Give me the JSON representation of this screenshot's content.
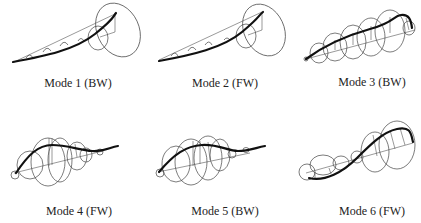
{
  "figure": {
    "panels": [
      {
        "id": "mode1",
        "label": "Mode 1 (BW)",
        "mode": 1,
        "whirl": "BW",
        "whirl_meaning": "backward whirl"
      },
      {
        "id": "mode2",
        "label": "Mode 2 (FW)",
        "mode": 2,
        "whirl": "FW",
        "whirl_meaning": "forward whirl"
      },
      {
        "id": "mode3",
        "label": "Mode 3 (BW)",
        "mode": 3,
        "whirl": "BW",
        "whirl_meaning": "backward whirl"
      },
      {
        "id": "mode4",
        "label": "Mode 4 (FW)",
        "mode": 4,
        "whirl": "FW",
        "whirl_meaning": "forward whirl"
      },
      {
        "id": "mode5",
        "label": "Mode 5 (BW)",
        "mode": 5,
        "whirl": "BW",
        "whirl_meaning": "backward whirl"
      },
      {
        "id": "mode6",
        "label": "Mode 6 (FW)",
        "mode": 6,
        "whirl": "FW",
        "whirl_meaning": "forward whirl"
      }
    ],
    "colors": {
      "background": "#ffffff",
      "curve": "#111111",
      "orbit": "#444444",
      "text": "#222222"
    }
  }
}
